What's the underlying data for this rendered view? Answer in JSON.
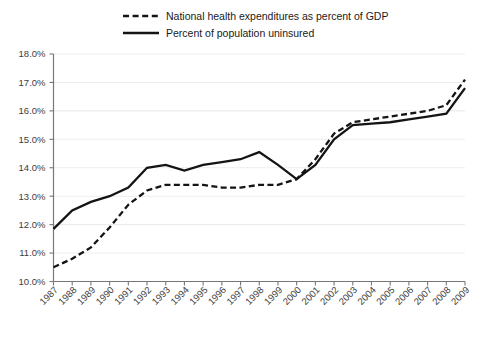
{
  "chart_data": {
    "type": "line",
    "title": "",
    "subtitle": "",
    "xlabel": "",
    "ylabel": "",
    "grid": true,
    "legend_position": "top",
    "ylim": [
      10.0,
      18.0
    ],
    "ytick_step": 1.0,
    "ytick_labels": [
      "18.0%",
      "17.0%",
      "16.0%",
      "15.0%",
      "14.0%",
      "13.0%",
      "12.0%",
      "11.0%",
      "10.0%"
    ],
    "ytick_values": [
      18.0,
      17.0,
      16.0,
      15.0,
      14.0,
      13.0,
      12.0,
      11.0,
      10.0
    ],
    "categories": [
      "1987",
      "1988",
      "1989",
      "1990",
      "1991",
      "1992",
      "1993",
      "1994",
      "1995",
      "1996",
      "1997",
      "1998",
      "1999",
      "2000",
      "2001",
      "2002",
      "2003",
      "2004",
      "2005",
      "2006",
      "2007",
      "2008",
      "2009"
    ],
    "x": [
      1987,
      1988,
      1989,
      1990,
      1991,
      1992,
      1993,
      1994,
      1995,
      1996,
      1997,
      1998,
      1999,
      2000,
      2001,
      2002,
      2003,
      2004,
      2005,
      2006,
      2007,
      2008,
      2009
    ],
    "series": [
      {
        "name": "National health expenditures as percent of GDP",
        "style": "dashed",
        "color": "#141414",
        "values": [
          10.5,
          10.8,
          11.2,
          11.9,
          12.7,
          13.2,
          13.4,
          13.4,
          13.4,
          13.3,
          13.3,
          13.4,
          13.4,
          13.6,
          14.3,
          15.2,
          15.6,
          15.7,
          15.8,
          15.9,
          16.0,
          16.2,
          17.1
        ]
      },
      {
        "name": "Percent of population uninsured",
        "style": "solid",
        "color": "#141414",
        "values": [
          11.85,
          12.5,
          12.8,
          13.0,
          13.3,
          14.0,
          14.1,
          13.9,
          14.1,
          14.2,
          14.3,
          14.55,
          14.1,
          13.6,
          14.1,
          15.0,
          15.5,
          15.55,
          15.6,
          15.7,
          15.8,
          15.9,
          16.8
        ]
      }
    ]
  },
  "legend": {
    "items": [
      {
        "label": "National health expenditures as percent of GDP",
        "style": "dashed"
      },
      {
        "label": "Percent of population uninsured",
        "style": "solid"
      }
    ]
  }
}
